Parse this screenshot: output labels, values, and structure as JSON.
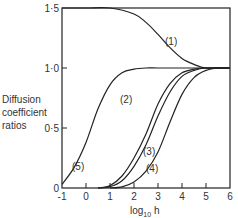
{
  "chart_data": {
    "type": "line",
    "title": "",
    "xlabel": "log10 h",
    "ylabel": "Diffusion coefficient ratios",
    "xlim": [
      -1,
      6
    ],
    "ylim": [
      0,
      1.5
    ],
    "grid": false,
    "x_ticks": [
      "-1",
      "0",
      "1",
      "2",
      "3",
      "4",
      "5",
      "6"
    ],
    "y_ticks": [
      "0",
      "0.5",
      "1.0",
      "1.5"
    ],
    "series": [
      {
        "name": "(1)",
        "x": [
          -1,
          0,
          1,
          2,
          2.5,
          3,
          3.5,
          4,
          4.5,
          5,
          6
        ],
        "y": [
          1.5,
          1.5,
          1.5,
          1.45,
          1.38,
          1.28,
          1.17,
          1.08,
          1.03,
          1.0,
          1.0
        ]
      },
      {
        "name": "(2)",
        "x": [
          0.5,
          1,
          1.5,
          2,
          2.5,
          3,
          3.5,
          4,
          4.5,
          5,
          6
        ],
        "y": [
          0,
          0.02,
          0.1,
          0.25,
          0.45,
          0.7,
          0.87,
          0.96,
          0.99,
          1.0,
          1.0
        ]
      },
      {
        "name": "(3)",
        "x": [
          0.5,
          1,
          1.5,
          2,
          2.5,
          3,
          3.5,
          4,
          4.5,
          5,
          6
        ],
        "y": [
          0,
          0.01,
          0.06,
          0.18,
          0.36,
          0.6,
          0.8,
          0.93,
          0.98,
          1.0,
          1.0
        ]
      },
      {
        "name": "(4)",
        "x": [
          1,
          1.5,
          2,
          2.5,
          3,
          3.5,
          4,
          4.5,
          5,
          5.5,
          6
        ],
        "y": [
          0,
          0.01,
          0.05,
          0.14,
          0.3,
          0.55,
          0.78,
          0.92,
          0.98,
          1.0,
          1.0
        ]
      },
      {
        "name": "(5)",
        "x": [
          -1,
          -0.5,
          0,
          0.5,
          1,
          1.5,
          2,
          2.5,
          3,
          4,
          6
        ],
        "y": [
          0.03,
          0.17,
          0.38,
          0.66,
          0.86,
          0.96,
          0.99,
          1.0,
          1.0,
          1.0,
          1.0
        ]
      }
    ],
    "annotations": [
      "(1)",
      "(2)",
      "(3)",
      "(4)",
      "(5)"
    ]
  },
  "labels": {
    "ylabel_lines": [
      "Diffusion",
      "coefficient",
      "ratios"
    ],
    "xlabel_prefix": "log",
    "xlabel_sub": "10",
    "xlabel_suffix": " h",
    "y_ticks": [
      "0",
      "0·5",
      "1·0",
      "1·5"
    ],
    "x_ticks": [
      "-1",
      "0",
      "1",
      "2",
      "3",
      "4",
      "5",
      "6"
    ],
    "curves": [
      "(1)",
      "(2)",
      "(3)",
      "(4)",
      "(5)"
    ]
  }
}
